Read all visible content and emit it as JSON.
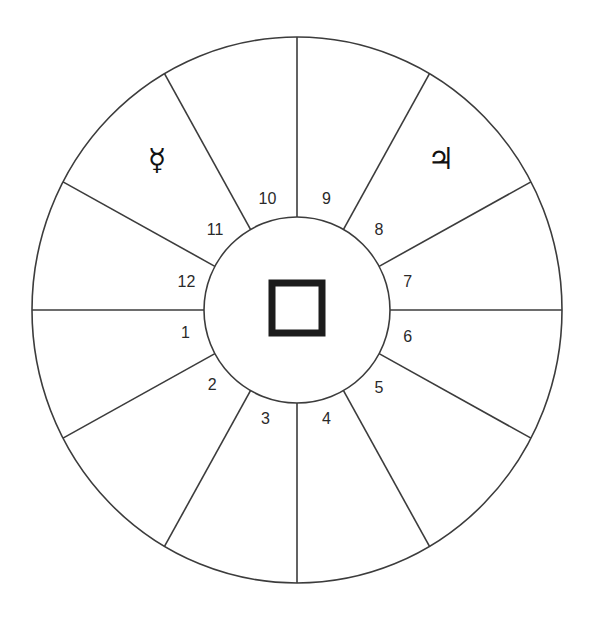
{
  "figure": {
    "background_color": "#ffffff",
    "line_color": "#3c3c3c",
    "center_symbol": "square"
  },
  "chart_data": {
    "type": "pie",
    "xlabel": "",
    "ylabel": "",
    "center_x": 297,
    "center_y": 310,
    "outer_radius_x": 265,
    "outer_radius_y": 273,
    "inner_radius": 93,
    "categories": [
      "1",
      "2",
      "3",
      "4",
      "5",
      "6",
      "7",
      "8",
      "9",
      "10",
      "11",
      "12"
    ],
    "values": [
      30,
      30,
      30,
      30,
      30,
      30,
      30,
      30,
      30,
      30,
      30,
      30
    ],
    "legend_position": "none",
    "grid": false,
    "cusp_angles_deg": [
      180,
      208,
      240,
      270,
      300,
      332,
      0,
      28,
      60,
      90,
      120,
      152
    ],
    "houses": [
      {
        "number": "1",
        "label_angle_deg": 192,
        "label_radius": 114
      },
      {
        "number": "2",
        "label_angle_deg": 222,
        "label_radius": 114
      },
      {
        "number": "3",
        "label_angle_deg": 254,
        "label_radius": 114
      },
      {
        "number": "4",
        "label_angle_deg": 285,
        "label_radius": 114
      },
      {
        "number": "5",
        "label_angle_deg": 316,
        "label_radius": 114
      },
      {
        "number": "6",
        "label_angle_deg": 346,
        "label_radius": 114
      },
      {
        "number": "7",
        "label_angle_deg": 14,
        "label_radius": 114
      },
      {
        "number": "8",
        "label_angle_deg": 44,
        "label_radius": 114
      },
      {
        "number": "9",
        "label_angle_deg": 75,
        "label_radius": 114
      },
      {
        "number": "10",
        "label_angle_deg": 105,
        "label_radius": 114
      },
      {
        "number": "11",
        "label_angle_deg": 136,
        "label_radius": 114
      },
      {
        "number": "12",
        "label_angle_deg": 166,
        "label_radius": 114
      }
    ],
    "planets": [
      {
        "name": "mercury",
        "glyph": "☿",
        "house": "11",
        "x": 157,
        "y": 161
      },
      {
        "name": "jupiter",
        "glyph": "♃",
        "house": "9",
        "x": 441,
        "y": 160
      }
    ]
  }
}
